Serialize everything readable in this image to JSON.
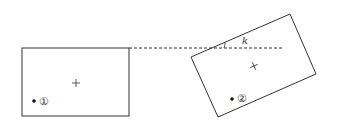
{
  "diagram": {
    "angle_label": "k",
    "markers": [
      {
        "id": "marker-1",
        "label": "①"
      },
      {
        "id": "marker-2",
        "label": "②"
      }
    ],
    "center_symbol": "+",
    "colors": {
      "line": "#333333",
      "background": "#ffffff"
    }
  }
}
